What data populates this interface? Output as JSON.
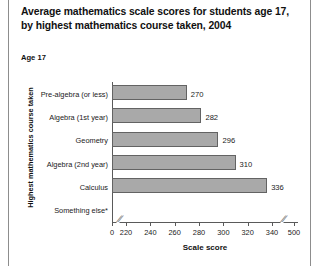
{
  "figure": {
    "title": "Average mathematics scale scores for students age 17, by highest mathematics course taken, 2004",
    "age_label": "Age 17"
  },
  "chart_data": {
    "type": "bar",
    "orientation": "horizontal",
    "title": "Average mathematics scale scores for students age 17, by highest mathematics course taken, 2004",
    "subtitle": "Age 17",
    "xlabel": "Scale score",
    "ylabel": "Highest mathematics course taken",
    "categories": [
      "Pre-algebra (or less)",
      "Algebra (1st year)",
      "Geometry",
      "Algebra (2nd year)",
      "Calculus",
      "Something else*"
    ],
    "values": [
      270,
      282,
      296,
      310,
      336,
      null
    ],
    "value_labels": [
      "270",
      "282",
      "296",
      "310",
      "336",
      ""
    ],
    "xticks": [
      0,
      220,
      240,
      260,
      280,
      300,
      320,
      340,
      500
    ],
    "xtick_labels": [
      "0",
      "220",
      "240",
      "260",
      "280",
      "300",
      "320",
      "340",
      "500"
    ],
    "axis_breaks": [
      "after 0",
      "between 340 and 500"
    ],
    "xlim": [
      220,
      340
    ],
    "grid": false,
    "legend": null,
    "bar_color": "#a9a9a9",
    "bar_border_color": "#636363"
  }
}
